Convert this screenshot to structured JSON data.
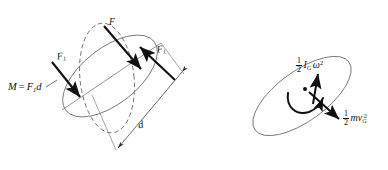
{
  "figure": {
    "background_color": "#ffffff",
    "stroke_color": "#444444",
    "arrow_color": "#111111",
    "text_color": "#111111",
    "panels": [
      {
        "id": "left-panel",
        "name": "couple-moment-diagram",
        "description": "Rigid body rotated by a couple; dashed outline is the original position, solid outline is the displaced position",
        "shapes": [
          {
            "name": "original-body-outline",
            "style": "dashed",
            "type": "ellipse"
          },
          {
            "name": "displaced-body-outline",
            "style": "solid",
            "type": "ellipse"
          }
        ],
        "arrows": [
          {
            "name": "force-F-arrow",
            "label": "F",
            "direction": "down-right"
          },
          {
            "name": "force-F1-arrow-left",
            "label": "F1",
            "direction": "down-right"
          },
          {
            "name": "force-F1-arrow-right",
            "label": "F1",
            "direction": "up-left"
          },
          {
            "name": "distance-d-dimension-arrow",
            "label": "d",
            "direction": "double-headed"
          }
        ],
        "labels": {
          "moment": {
            "M": "M",
            "equals": "=",
            "F": "F",
            "sub": "1",
            "d": "d"
          },
          "force_F": "F",
          "force_F1": {
            "F": "F",
            "sub": "1"
          },
          "distance": "d"
        }
      },
      {
        "id": "right-panel",
        "name": "kinetic-energy-diagram",
        "description": "Rigid body in general plane motion with rotational and translational kinetic energy terms at the mass center G",
        "shapes": [
          {
            "name": "body-outline",
            "style": "solid",
            "type": "ellipse"
          },
          {
            "name": "mass-center-point",
            "style": "filled-dot",
            "type": "point"
          }
        ],
        "arrows": [
          {
            "name": "angular-velocity-curved-arrow",
            "label": "omega",
            "direction": "counter-clockwise"
          },
          {
            "name": "rotational-energy-arrow",
            "direction": "up"
          },
          {
            "name": "translational-energy-arrow",
            "direction": "down-right"
          }
        ],
        "labels": {
          "rotational_energy": {
            "num": "1",
            "den": "2",
            "I": "I",
            "sub": "G",
            "omega": "ω",
            "sup": "2"
          },
          "translational_energy": {
            "num": "1",
            "den": "2",
            "m": "m",
            "v": "v",
            "sub": "G",
            "sup": "2"
          }
        }
      }
    ]
  }
}
